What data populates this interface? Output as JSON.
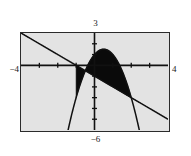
{
  "figure": {
    "kind": "graphing-calculator-plot",
    "background_color": "#ffffff",
    "plot_background_color": "#e3e3e3",
    "frame_color": "#2b2b2b",
    "curve_color": "#111111",
    "shade_color": "#0a0a0a"
  },
  "labels": {
    "y_max": "3",
    "y_min": "−6",
    "x_min": "−4",
    "x_max": "4"
  },
  "chart_data": {
    "type": "line",
    "title": "",
    "xlabel": "",
    "ylabel": "",
    "xlim": [
      -4,
      4
    ],
    "ylim": [
      -6,
      3
    ],
    "grid": false,
    "legend": "none",
    "xticks": [
      -3,
      -2,
      -1,
      0,
      1,
      2,
      3
    ],
    "yticks": [
      -5,
      -4,
      -3,
      -2,
      -1,
      1,
      2
    ],
    "tick_labels_shown": false,
    "axes": {
      "x_axis_at_y": 0,
      "y_axis_at_x": 0,
      "x_axis_drawn": true,
      "y_axis_drawn": true
    },
    "series": [
      {
        "name": "line",
        "type": "line",
        "equation": "y = -x - 1",
        "x": [
          -4,
          -3,
          -2,
          -1,
          0,
          1,
          2,
          3,
          4
        ],
        "values": [
          3,
          2,
          1,
          0,
          -1,
          -2,
          -3,
          -4,
          -5
        ]
      },
      {
        "name": "parabola",
        "type": "line",
        "equation": "y = -2x^2 + 2x + 1",
        "x": [
          -2.0,
          -1.5,
          -1.0,
          -0.5,
          0.0,
          0.5,
          1.0,
          1.5,
          2.0,
          2.3
        ],
        "values": [
          -11.0,
          -6.5,
          -3.0,
          -0.5,
          1.0,
          1.5,
          1.0,
          -0.5,
          -3.0,
          -4.98
        ]
      }
    ],
    "shaded_region": {
      "description": "region between the line and the parabola",
      "between": [
        "parabola",
        "line"
      ],
      "x_range": [
        -1,
        2
      ],
      "fill": "#0a0a0a"
    }
  }
}
